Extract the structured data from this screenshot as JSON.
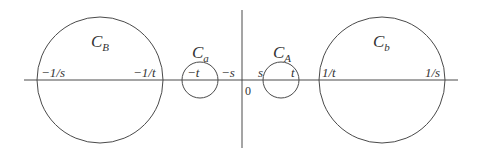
{
  "diagram": {
    "stroke_color": "#4a4a4a",
    "text_color": "#333333",
    "axes": {
      "horizontal": {
        "x1": 24,
        "x2": 458,
        "y": 80
      },
      "vertical": {
        "x": 242,
        "y1": 10,
        "y2": 148
      },
      "origin_label": "0"
    },
    "circles": [
      {
        "id": "C_B",
        "name": "C",
        "sub": "B",
        "cx": 100,
        "cy": 80,
        "r": 63,
        "label_x": 91,
        "label_y": 47,
        "left_point": "−1/s",
        "right_point": "−1/t"
      },
      {
        "id": "C_a",
        "name": "C",
        "sub": "a",
        "cx": 200,
        "cy": 80,
        "r": 18,
        "label_x": 192,
        "label_y": 57,
        "left_point": "−t",
        "right_point": ""
      },
      {
        "id": "C_A",
        "name": "C",
        "sub": "A",
        "cx": 281,
        "cy": 80,
        "r": 18,
        "label_x": 273,
        "label_y": 57,
        "left_point": "s",
        "right_point": "t"
      },
      {
        "id": "C_b",
        "name": "C",
        "sub": "b",
        "cx": 382,
        "cy": 80,
        "r": 63,
        "label_x": 373,
        "label_y": 47,
        "left_point": "1/t",
        "right_point": "1/s"
      }
    ],
    "point_labels": [
      {
        "text": "−1/s",
        "x": 43,
        "y": 76
      },
      {
        "text": "−1/t",
        "x": 135,
        "y": 76
      },
      {
        "text": "−t",
        "x": 190,
        "y": 76
      },
      {
        "text": "−s",
        "x": 222,
        "y": 76
      },
      {
        "text": "s",
        "x": 258,
        "y": 76
      },
      {
        "text": "t",
        "x": 292,
        "y": 76
      },
      {
        "text": "1/t",
        "x": 320,
        "y": 76
      },
      {
        "text": "1/s",
        "x": 424,
        "y": 76
      }
    ]
  }
}
